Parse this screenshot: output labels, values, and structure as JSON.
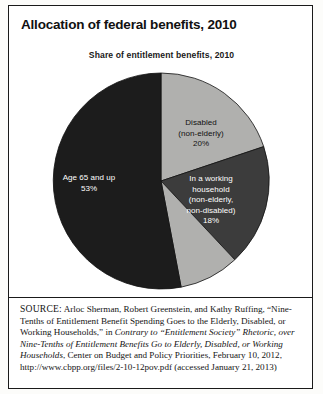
{
  "figure": {
    "title": "Allocation of federal benefits, 2010",
    "subtitle": "Share of entitlement benefits, 2010"
  },
  "chart_data": {
    "type": "pie",
    "title": "Share of entitlement benefits, 2010",
    "legend_position": "none",
    "labels_inside": true,
    "categories": [
      "Disabled (non-elderly)",
      "In a working household (non-elderly, non-disabled)",
      "Other",
      "Age 65 and up"
    ],
    "values": [
      20,
      18,
      9,
      53
    ],
    "slices": [
      {
        "name": "disabled-non-elderly",
        "label_lines": [
          "Disabled",
          "(non-elderly)",
          "20%"
        ],
        "value": 20,
        "percent_text": "20%",
        "color": "#b0b0ae",
        "text_color": "#111111"
      },
      {
        "name": "working-household",
        "label_lines": [
          "In a working",
          "household",
          "(non-elderly,",
          "non-disabled)",
          "18%"
        ],
        "value": 18,
        "percent_text": "18%",
        "color": "#3c3c3c",
        "text_color": "#ffffff"
      },
      {
        "name": "unlabeled-other",
        "label_lines": [],
        "value": 9,
        "percent_text": "",
        "color": "#b0b0ae",
        "text_color": "#111111"
      },
      {
        "name": "age-65-and-up",
        "label_lines": [
          "Age 65 and up",
          "53%"
        ],
        "value": 53,
        "percent_text": "53%",
        "color": "#1c1c1c",
        "text_color": "#ffffff"
      }
    ],
    "colors": {
      "dark_slice": "#1c1c1c",
      "mid_dark_slice": "#3c3c3c",
      "light_slice": "#b0b0ae",
      "outline": "#111111"
    }
  },
  "labels": {
    "age65": "Age 65 and up\n53%",
    "disabled": "Disabled\n(non-elderly)\n20%",
    "working": "In a working\nhousehold\n(non-elderly,\nnon-disabled)\n18%"
  },
  "source": {
    "prefix": "SOURCE:",
    "authors_and_article": " Arloc Sherman, Robert Greenstein, and Kathy Ruffing, “Nine-Tenths of Entitlement Benefit Spending Goes to the Elderly, Disabled, or Working Households,” in ",
    "publication_italic": "Contrary to “Entitlement Society” Rhetoric, over Nine-Tenths of Entitlement Benefits Go to Elderly, Disabled, or Working Households",
    "publisher_and_date": ", Center on Budget and Policy Priorities, February 10, 2012, http://www.cbpp.org/files/2-10-12pov.pdf (accessed January 21, 2013)"
  }
}
